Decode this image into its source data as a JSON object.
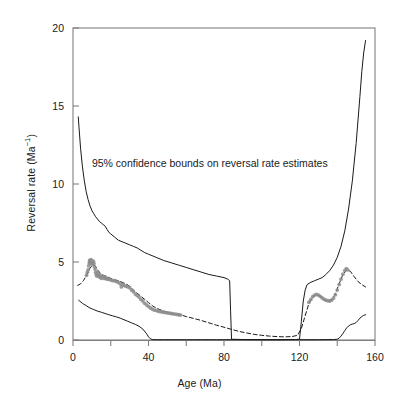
{
  "figure": {
    "background": "#ffffff",
    "frame_color": "#808080",
    "line_color": "#1a1a1a",
    "point_color": "#8c8c8c"
  },
  "axes": {
    "x_title": "Age (Ma)",
    "y_title_main": "Reversal rate (Ma",
    "y_title_sup": "−1",
    "y_title_close": ")",
    "x_ticks_major": [
      0,
      40,
      80,
      120,
      160
    ],
    "x_ticks_minor": [
      20,
      60,
      100,
      140
    ],
    "y_ticks_major": [
      0,
      5,
      10,
      15,
      20
    ],
    "x_tick_labels": [
      "0",
      "40",
      "80",
      "120",
      "160"
    ],
    "y_tick_labels": [
      "0",
      "5",
      "10",
      "15",
      "20"
    ]
  },
  "annotation": {
    "text": "95% confidence bounds on reversal rate estimates",
    "x_ma": 10,
    "y_rate": 11.1
  },
  "chart_data": {
    "type": "line",
    "title": "",
    "xlabel": "Age (Ma)",
    "ylabel": "Reversal rate (Ma−1)",
    "xlim": [
      0,
      160
    ],
    "ylim": [
      0,
      20
    ],
    "grid": false,
    "legend": null,
    "annotations": [
      {
        "text": "95% confidence bounds on reversal rate estimates",
        "x": 10,
        "y": 11.1
      }
    ],
    "series": [
      {
        "name": "Upper 95% confidence bound",
        "style": "solid",
        "color": "#1a1a1a",
        "x": [
          2.8,
          3.2,
          4.0,
          5.0,
          6.0,
          7.0,
          8.0,
          9.0,
          10.0,
          11.0,
          12.0,
          13.0,
          14.0,
          15.0,
          16.0,
          17.0,
          18.0,
          19.0,
          20.0,
          22.0,
          24.0,
          26.0,
          28.0,
          30.0,
          32.0,
          34.0,
          36.0,
          38.0,
          40.0,
          44.0,
          48.0,
          52.0,
          56.0,
          60.0,
          64.0,
          68.0,
          72.0,
          76.0,
          80.0,
          82.0,
          83.0,
          83.5,
          84.0,
          90.0,
          100.0,
          110.0,
          118.0,
          120.0,
          121.0,
          122.0,
          123.0,
          124.0,
          126.0,
          128.0,
          130.0,
          132.0,
          134.0,
          136.0,
          138.0,
          140.0,
          142.0,
          144.0,
          146.0,
          148.0,
          150.0,
          152.0,
          153.0,
          154.0,
          155.0
        ],
        "y": [
          14.3,
          13.6,
          12.3,
          11.1,
          10.2,
          9.5,
          9.0,
          8.6,
          8.3,
          8.1,
          7.9,
          7.75,
          7.6,
          7.5,
          7.4,
          7.3,
          7.1,
          6.9,
          6.8,
          6.6,
          6.4,
          6.3,
          6.2,
          6.1,
          6.0,
          5.9,
          5.75,
          5.6,
          5.5,
          5.3,
          5.1,
          4.95,
          4.8,
          4.65,
          4.5,
          4.35,
          4.2,
          4.1,
          4.0,
          3.9,
          3.8,
          1.8,
          0.05,
          0.03,
          0.02,
          0.02,
          0.03,
          0.05,
          1.2,
          2.5,
          3.2,
          3.55,
          3.7,
          3.8,
          3.9,
          4.0,
          4.2,
          4.45,
          4.8,
          5.3,
          6.0,
          7.0,
          8.4,
          10.2,
          12.6,
          15.6,
          17.2,
          18.4,
          19.2
        ]
      },
      {
        "name": "Lower 95% confidence bound",
        "style": "solid",
        "color": "#1a1a1a",
        "x": [
          3.0,
          5.0,
          7.0,
          9.0,
          11.0,
          13.0,
          15.0,
          17.0,
          19.0,
          21.0,
          23.0,
          25.0,
          27.0,
          29.0,
          31.0,
          33.0,
          35.0,
          37.0,
          39.0,
          40.0,
          41.0,
          42.0,
          44.0,
          48.0,
          52.0,
          56.0,
          60.0,
          64.0,
          68.0,
          72.0,
          76.0,
          80.0,
          84.0,
          90.0,
          100.0,
          110.0,
          120.0,
          130.0,
          138.0,
          140.0,
          141.0,
          142.0,
          143.0,
          144.0,
          145.0,
          146.0,
          147.0,
          148.0,
          149.0,
          150.0,
          151.0,
          152.0,
          153.0,
          154.0,
          155.0
        ],
        "y": [
          2.55,
          2.35,
          2.2,
          2.05,
          1.95,
          1.85,
          1.78,
          1.7,
          1.62,
          1.55,
          1.48,
          1.4,
          1.3,
          1.2,
          1.1,
          1.0,
          0.88,
          0.7,
          0.4,
          0.2,
          0.08,
          0.03,
          0.02,
          0.02,
          0.02,
          0.02,
          0.02,
          0.02,
          0.02,
          0.02,
          0.02,
          0.02,
          0.02,
          0.02,
          0.02,
          0.02,
          0.02,
          0.02,
          0.03,
          0.05,
          0.12,
          0.25,
          0.42,
          0.6,
          0.78,
          0.9,
          0.98,
          1.02,
          1.05,
          1.12,
          1.25,
          1.4,
          1.5,
          1.58,
          1.62
        ]
      },
      {
        "name": "Reversal rate estimate",
        "style": "dashed",
        "color": "#1a1a1a",
        "x": [
          2.5,
          4.0,
          5.5,
          7.0,
          8.0,
          9.0,
          10.0,
          11.0,
          12.0,
          13.0,
          14.0,
          15.0,
          16.0,
          17.0,
          18.0,
          19.0,
          20.0,
          22.0,
          24.0,
          26.0,
          28.0,
          30.0,
          32.0,
          34.0,
          36.0,
          38.0,
          40.0,
          42.0,
          44.0,
          46.0,
          48.0,
          50.0,
          52.0,
          54.0,
          56.0,
          58.0,
          60.0,
          64.0,
          68.0,
          72.0,
          76.0,
          80.0,
          84.0,
          88.0,
          92.0,
          96.0,
          100.0,
          104.0,
          108.0,
          112.0,
          116.0,
          119.0,
          121.0,
          123.0,
          125.0,
          127.0,
          129.0,
          131.0,
          133.0,
          135.0,
          137.0,
          139.0,
          141.0,
          143.0,
          145.0,
          147.0,
          149.0,
          151.0,
          153.0,
          155.0
        ],
        "y": [
          3.5,
          3.6,
          3.8,
          4.1,
          4.35,
          4.6,
          4.75,
          4.8,
          4.7,
          4.5,
          4.35,
          4.2,
          4.15,
          4.1,
          4.05,
          4.0,
          3.95,
          3.85,
          3.8,
          3.7,
          3.6,
          3.45,
          3.2,
          3.0,
          2.8,
          2.6,
          2.4,
          2.2,
          2.05,
          1.95,
          1.85,
          1.78,
          1.72,
          1.68,
          1.62,
          1.58,
          1.5,
          1.38,
          1.25,
          1.1,
          0.95,
          0.82,
          0.68,
          0.55,
          0.45,
          0.36,
          0.3,
          0.25,
          0.22,
          0.2,
          0.22,
          0.3,
          0.75,
          1.55,
          2.35,
          2.75,
          2.9,
          2.8,
          2.55,
          2.45,
          2.55,
          2.95,
          3.6,
          4.2,
          4.5,
          4.4,
          4.05,
          3.75,
          3.55,
          3.4
        ]
      }
    ],
    "scatter": [
      {
        "name": "Reversal rate data points (left segment)",
        "color": "#8c8c8c",
        "points": [
          [
            7.2,
            4.15
          ],
          [
            7.6,
            4.35
          ],
          [
            8.0,
            4.5
          ],
          [
            8.3,
            4.75
          ],
          [
            8.6,
            4.95
          ],
          [
            8.8,
            5.1
          ],
          [
            9.0,
            5.05
          ],
          [
            9.2,
            4.9
          ],
          [
            9.4,
            5.0
          ],
          [
            9.6,
            5.15
          ],
          [
            9.9,
            5.0
          ],
          [
            10.2,
            4.85
          ],
          [
            10.5,
            4.95
          ],
          [
            10.8,
            5.05
          ],
          [
            11.1,
            4.9
          ],
          [
            11.4,
            4.7
          ],
          [
            11.7,
            4.55
          ],
          [
            12.0,
            4.35
          ],
          [
            12.3,
            4.2
          ],
          [
            12.6,
            4.1
          ],
          [
            13.0,
            4.35
          ],
          [
            13.4,
            4.2
          ],
          [
            13.8,
            4.05
          ],
          [
            14.2,
            4.15
          ],
          [
            14.6,
            4.05
          ],
          [
            15.0,
            3.95
          ],
          [
            15.5,
            4.1
          ],
          [
            16.0,
            4.05
          ],
          [
            16.5,
            3.95
          ],
          [
            17.0,
            4.05
          ],
          [
            17.5,
            3.95
          ],
          [
            18.0,
            3.9
          ],
          [
            18.6,
            3.95
          ],
          [
            19.2,
            3.88
          ],
          [
            20.0,
            3.85
          ],
          [
            21.0,
            3.8
          ],
          [
            22.0,
            3.8
          ],
          [
            23.0,
            3.75
          ],
          [
            24.0,
            3.7
          ],
          [
            25.0,
            3.6
          ],
          [
            25.6,
            3.4
          ],
          [
            26.2,
            3.55
          ],
          [
            27.0,
            3.5
          ],
          [
            28.0,
            3.45
          ],
          [
            29.0,
            3.4
          ],
          [
            30.0,
            3.35
          ],
          [
            31.0,
            3.2
          ],
          [
            32.0,
            3.1
          ],
          [
            33.0,
            2.95
          ],
          [
            34.0,
            2.85
          ],
          [
            35.0,
            2.75
          ],
          [
            36.0,
            2.6
          ],
          [
            37.0,
            2.5
          ],
          [
            38.0,
            2.35
          ],
          [
            39.0,
            2.25
          ],
          [
            40.0,
            2.15
          ],
          [
            41.0,
            2.05
          ],
          [
            42.0,
            1.98
          ],
          [
            43.0,
            1.92
          ],
          [
            44.0,
            1.9
          ],
          [
            45.0,
            1.85
          ],
          [
            46.0,
            1.82
          ],
          [
            47.0,
            1.8
          ],
          [
            48.0,
            1.78
          ],
          [
            49.0,
            1.76
          ],
          [
            50.0,
            1.74
          ],
          [
            51.0,
            1.72
          ],
          [
            52.0,
            1.7
          ],
          [
            53.0,
            1.68
          ],
          [
            54.0,
            1.66
          ],
          [
            55.0,
            1.64
          ],
          [
            56.0,
            1.62
          ],
          [
            57.0,
            1.6
          ]
        ]
      },
      {
        "name": "Reversal rate data points (right segment)",
        "color": "#8c8c8c",
        "points": [
          [
            125.0,
            2.42
          ],
          [
            126.0,
            2.6
          ],
          [
            127.0,
            2.78
          ],
          [
            128.0,
            2.88
          ],
          [
            129.0,
            2.92
          ],
          [
            130.0,
            2.88
          ],
          [
            131.0,
            2.8
          ],
          [
            132.0,
            2.7
          ],
          [
            133.0,
            2.62
          ],
          [
            134.0,
            2.55
          ],
          [
            135.0,
            2.52
          ],
          [
            136.0,
            2.5
          ],
          [
            137.0,
            2.55
          ],
          [
            138.0,
            2.68
          ],
          [
            139.0,
            2.9
          ],
          [
            140.0,
            3.2
          ],
          [
            141.0,
            3.55
          ],
          [
            142.0,
            3.9
          ],
          [
            143.0,
            4.22
          ],
          [
            144.0,
            4.45
          ],
          [
            144.8,
            4.58
          ],
          [
            145.5,
            4.5
          ]
        ]
      }
    ]
  }
}
